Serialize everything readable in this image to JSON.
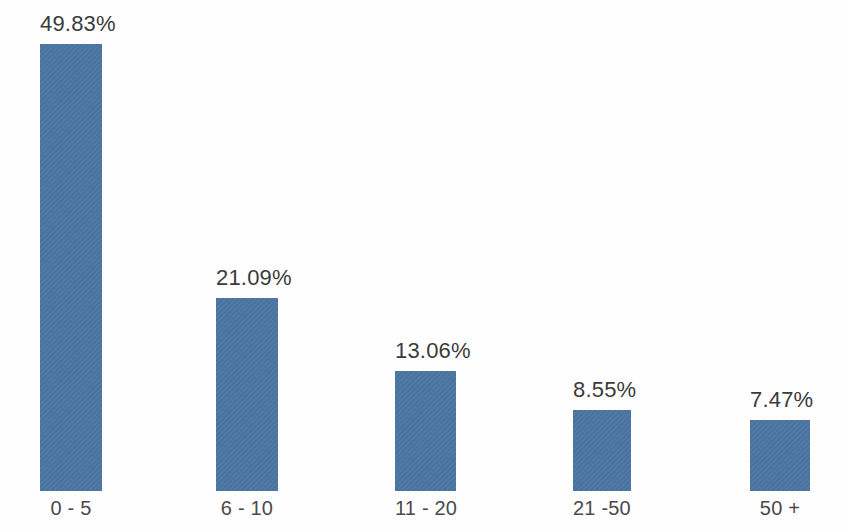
{
  "chart_data": {
    "type": "bar",
    "title": "",
    "subtitle": "",
    "xlabel": "",
    "ylabel": "",
    "categories": [
      "0 - 5",
      "6 - 10",
      "11 - 20",
      "21 -50",
      "50 +"
    ],
    "values": [
      49.83,
      21.09,
      13.06,
      8.55,
      7.47
    ],
    "value_labels": [
      "49.83%",
      "21.09%",
      "13.06%",
      "8.55%",
      "7.47%"
    ],
    "series": [
      {
        "name": "",
        "values": [
          49.83,
          21.09,
          13.06,
          8.55,
          7.47
        ]
      }
    ],
    "ylim": [
      0,
      49.83
    ],
    "unit": "%",
    "grid": false,
    "legend": false,
    "legend_position": "none",
    "axis_line": false,
    "tick_labels_y": [],
    "annotations": []
  },
  "style": {
    "bar_color": "#4a74a0",
    "background_color": "#fefefe",
    "value_label_color": "#3b3b3b",
    "category_label_color": "#4a4a4a"
  },
  "bars": [
    {
      "category": "0 - 5",
      "value_label": "49.83%",
      "left_px": 40,
      "width_px": 62,
      "top_px": 44
    },
    {
      "category": "6 - 10",
      "value_label": "21.09%",
      "left_px": 216,
      "width_px": 62,
      "top_px": 298
    },
    {
      "category": "11 - 20",
      "value_label": "13.06%",
      "left_px": 395,
      "width_px": 61,
      "top_px": 371
    },
    {
      "category": "21 -50",
      "value_label": "8.55%",
      "left_px": 573,
      "width_px": 58,
      "top_px": 410
    },
    {
      "category": "50 +",
      "value_label": "7.47%",
      "left_px": 750,
      "width_px": 60,
      "top_px": 420
    }
  ]
}
